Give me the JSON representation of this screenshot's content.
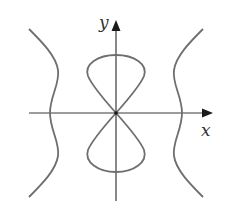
{
  "diagram": {
    "type": "curve-plot",
    "axes": {
      "x_label": "x",
      "y_label": "y",
      "x_arrow": true,
      "y_arrow": true
    },
    "colors": {
      "curve": "#6e6e6e",
      "axis": "#3a3a3a",
      "label": "#333333",
      "background": "#ffffff"
    },
    "components": [
      {
        "name": "figure-eight",
        "description": "Lemniscate-like loop with upper and lower lobes crossing at origin"
      },
      {
        "name": "left-branch",
        "description": "Wavy vertical branch left of y-axis"
      },
      {
        "name": "right-branch",
        "description": "Wavy vertical branch right of y-axis"
      }
    ]
  }
}
